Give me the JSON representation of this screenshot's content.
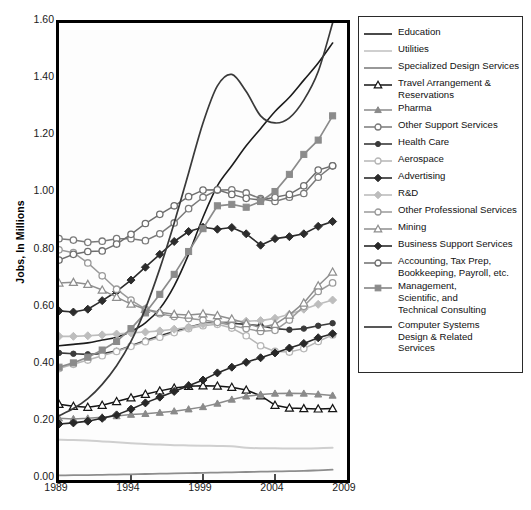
{
  "chart_data": {
    "type": "line",
    "title": "",
    "xlabel": "",
    "ylabel": "Jobs, In Millions",
    "xlim": [
      1989,
      2009
    ],
    "ylim": [
      0.0,
      1.6
    ],
    "ytick_labels": [
      "1.60",
      "1.40",
      "1.20",
      "1.00",
      "0.80",
      "0.60",
      "0.40",
      "0.20",
      "0.00"
    ],
    "ytick_values": [
      1.6,
      1.4,
      1.2,
      1.0,
      0.8,
      0.6,
      0.4,
      0.2,
      0.0
    ],
    "xtick_labels": [
      "1989",
      "1994",
      "1999",
      "2004",
      "2009"
    ],
    "xtick_values": [
      1989,
      1994,
      1999,
      2004,
      2009
    ],
    "grid": false,
    "legend_position": "right",
    "x": [
      1989,
      1990,
      1991,
      1992,
      1993,
      1994,
      1995,
      1996,
      1997,
      1998,
      1999,
      2000,
      2001,
      2002,
      2003,
      2004,
      2005,
      2006,
      2007,
      2008
    ],
    "series": [
      {
        "name": "Education",
        "label": "Education",
        "color": "#1c1c1c",
        "marker": "none",
        "width": 1.6,
        "values": [
          0.47,
          0.475,
          0.48,
          0.49,
          0.5,
          0.52,
          0.55,
          0.6,
          0.68,
          0.79,
          0.92,
          1.03,
          1.1,
          1.17,
          1.23,
          1.29,
          1.34,
          1.4,
          1.46,
          1.53
        ]
      },
      {
        "name": "Utilities",
        "label": "Utilities",
        "color": "#cfcfcf",
        "marker": "none",
        "width": 2.0,
        "values": [
          0.141,
          0.14,
          0.138,
          0.135,
          0.132,
          0.129,
          0.126,
          0.124,
          0.122,
          0.121,
          0.12,
          0.119,
          0.118,
          0.113,
          0.111,
          0.111,
          0.11,
          0.11,
          0.111,
          0.113
        ]
      },
      {
        "name": "Specialized Design Services",
        "label": "Specialized Design Services",
        "color": "#8d8d8d",
        "marker": "none",
        "width": 1.8,
        "values": [
          0.016,
          0.017,
          0.017,
          0.018,
          0.019,
          0.02,
          0.021,
          0.022,
          0.023,
          0.024,
          0.025,
          0.026,
          0.027,
          0.028,
          0.029,
          0.03,
          0.031,
          0.032,
          0.034,
          0.036
        ]
      },
      {
        "name": "Travel Arrangement & Reservations",
        "label": "Travel Arrangement &\nReservations",
        "color": "#141414",
        "marker": "triangle-open",
        "width": 1.5,
        "values": [
          0.265,
          0.258,
          0.255,
          0.262,
          0.275,
          0.288,
          0.3,
          0.312,
          0.322,
          0.328,
          0.33,
          0.329,
          0.325,
          0.315,
          0.295,
          0.262,
          0.252,
          0.25,
          0.249,
          0.25
        ]
      },
      {
        "name": "Pharma",
        "label": "Pharma",
        "color": "#8a8a8a",
        "marker": "triangle-filled",
        "width": 1.5,
        "values": [
          0.216,
          0.214,
          0.216,
          0.22,
          0.224,
          0.229,
          0.232,
          0.236,
          0.241,
          0.248,
          0.256,
          0.268,
          0.282,
          0.293,
          0.299,
          0.303,
          0.304,
          0.303,
          0.3,
          0.296
        ]
      },
      {
        "name": "Other Support Services",
        "label": "Other Support Services",
        "color": "#7a7a7a",
        "marker": "circle-open",
        "width": 1.5,
        "values": [
          0.845,
          0.84,
          0.832,
          0.836,
          0.845,
          0.845,
          0.838,
          0.862,
          0.9,
          0.95,
          0.99,
          1.015,
          1.016,
          1.005,
          0.985,
          0.975,
          0.99,
          1.003,
          1.06,
          1.1
        ]
      },
      {
        "name": "Health Care",
        "label": "Health Care",
        "color": "#3a3a3a",
        "marker": "circle-filled",
        "width": 1.6,
        "values": [
          0.445,
          0.442,
          0.44,
          0.442,
          0.452,
          0.47,
          0.488,
          0.505,
          0.52,
          0.535,
          0.548,
          0.553,
          0.549,
          0.545,
          0.54,
          0.53,
          0.526,
          0.53,
          0.54,
          0.549
        ]
      },
      {
        "name": "Aerospace",
        "label": "Aerospace",
        "color": "#b6b6b6",
        "marker": "circle-open",
        "width": 1.5,
        "values": [
          0.39,
          0.405,
          0.42,
          0.435,
          0.45,
          0.468,
          0.484,
          0.5,
          0.516,
          0.53,
          0.54,
          0.545,
          0.532,
          0.505,
          0.47,
          0.45,
          0.448,
          0.46,
          0.485,
          0.508
        ]
      },
      {
        "name": "Advertising",
        "label": "Advertising",
        "color": "#2c2c2c",
        "marker": "diamond-filled",
        "width": 1.6,
        "values": [
          0.592,
          0.588,
          0.598,
          0.628,
          0.66,
          0.7,
          0.745,
          0.79,
          0.835,
          0.87,
          0.885,
          0.878,
          0.884,
          0.862,
          0.822,
          0.845,
          0.852,
          0.862,
          0.888,
          0.905
        ]
      },
      {
        "name": "R&D",
        "label": "R&D",
        "color": "#bdbdbd",
        "marker": "diamond-filled",
        "width": 1.6,
        "values": [
          0.503,
          0.503,
          0.505,
          0.508,
          0.511,
          0.515,
          0.518,
          0.522,
          0.528,
          0.535,
          0.545,
          0.552,
          0.556,
          0.556,
          0.558,
          0.566,
          0.58,
          0.598,
          0.615,
          0.63
        ]
      },
      {
        "name": "Other Professional Services",
        "label": "Other Professional Services",
        "color": "#9a9a9a",
        "marker": "circle-open",
        "width": 1.5,
        "values": [
          0.806,
          0.796,
          0.76,
          0.715,
          0.668,
          0.63,
          0.598,
          0.582,
          0.572,
          0.565,
          0.56,
          0.552,
          0.541,
          0.53,
          0.52,
          0.524,
          0.56,
          0.608,
          0.66,
          0.69
        ]
      },
      {
        "name": "Mining",
        "label": "Mining",
        "color": "#8e8e8e",
        "marker": "triangle-open",
        "width": 1.5,
        "values": [
          0.69,
          0.692,
          0.685,
          0.665,
          0.64,
          0.616,
          0.598,
          0.587,
          0.58,
          0.578,
          0.582,
          0.576,
          0.564,
          0.548,
          0.534,
          0.545,
          0.578,
          0.62,
          0.68,
          0.728
        ]
      },
      {
        "name": "Business Support Services",
        "label": "Business Support Services",
        "color": "#282828",
        "marker": "diamond-filled",
        "width": 1.6,
        "values": [
          0.196,
          0.2,
          0.206,
          0.216,
          0.228,
          0.248,
          0.27,
          0.29,
          0.31,
          0.33,
          0.35,
          0.375,
          0.395,
          0.412,
          0.428,
          0.445,
          0.462,
          0.478,
          0.498,
          0.512
        ]
      },
      {
        "name": "Accounting, Tax Prep, Bookkeeping, Payroll, etc.",
        "label": "Accounting, Tax Prep,\nBookkeeping, Payroll, etc.",
        "color": "#6e6e6e",
        "marker": "circle-open",
        "width": 1.5,
        "values": [
          0.77,
          0.79,
          0.8,
          0.802,
          0.826,
          0.86,
          0.898,
          0.93,
          0.96,
          0.992,
          1.015,
          1.016,
          1.0,
          0.986,
          0.98,
          0.99,
          1.0,
          1.03,
          1.085,
          1.1
        ]
      },
      {
        "name": "Management, Scientific, and Technical Consulting",
        "label": "Management,\nScientific, and\nTechnical Consulting",
        "color": "#8b8b8b",
        "marker": "square-filled",
        "width": 1.7,
        "values": [
          0.395,
          0.41,
          0.43,
          0.455,
          0.485,
          0.53,
          0.585,
          0.65,
          0.72,
          0.8,
          0.88,
          0.96,
          0.965,
          0.955,
          0.975,
          1.01,
          1.07,
          1.14,
          1.19,
          1.275
        ]
      },
      {
        "name": "Computer Systems Design & Related Services",
        "label": "Computer Systems\nDesign & Related\nServices",
        "color": "#3a3a3a",
        "marker": "none",
        "width": 1.7,
        "values": [
          0.225,
          0.25,
          0.285,
          0.335,
          0.4,
          0.485,
          0.6,
          0.74,
          0.9,
          1.075,
          1.25,
          1.38,
          1.42,
          1.36,
          1.275,
          1.25,
          1.268,
          1.33,
          1.43,
          1.6
        ]
      }
    ]
  }
}
